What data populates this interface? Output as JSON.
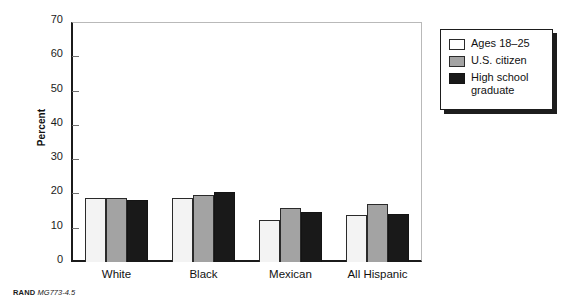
{
  "figure": {
    "footer_source": "RAND",
    "footer_number": "MG773-4.5"
  },
  "chart_data": {
    "type": "bar",
    "title": "",
    "subtitle": "",
    "xlabel": "",
    "ylabel": "Percent",
    "ylim": [
      0,
      70
    ],
    "yticks": [
      0,
      10,
      20,
      30,
      40,
      50,
      60,
      70
    ],
    "ytick_labels": [
      "0",
      "10",
      "20",
      "30",
      "40",
      "50",
      "60",
      "70"
    ],
    "grid": false,
    "legend_position": "outside-right-top",
    "categories": [
      "White",
      "Black",
      "Mexican",
      "All Hispanic"
    ],
    "series": [
      {
        "name": "Ages 18–25",
        "color": "#f3f3f3",
        "values": [
          18.7,
          18.8,
          12.3,
          13.8
        ]
      },
      {
        "name": "U.S. citizen",
        "color": "#a3a3a3",
        "values": [
          18.7,
          19.6,
          15.7,
          17.0
        ]
      },
      {
        "name": "High school graduate",
        "color": "#191919",
        "values": [
          18.2,
          20.5,
          14.6,
          13.9
        ]
      }
    ]
  }
}
